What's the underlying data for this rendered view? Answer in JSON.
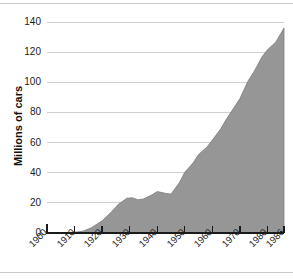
{
  "chart_data": {
    "type": "area",
    "title": "",
    "subtitle": "",
    "xlabel": "",
    "ylabel": "Millions of cars",
    "xlim": [
      1900,
      1986
    ],
    "ylim": [
      0,
      140
    ],
    "grid": true,
    "legend": null,
    "fill_color": "#969696",
    "line_color": "#7d7d7d",
    "grid_color": "#d0d0d0",
    "axis_color": "#1a1a1a",
    "y_ticks": [
      0,
      20,
      40,
      60,
      80,
      100,
      120,
      140
    ],
    "y_tick_labels": [
      "0",
      "20",
      "40",
      "60",
      "80",
      "100",
      "120",
      "140"
    ],
    "x_ticks": [
      1900,
      1910,
      1920,
      1930,
      1940,
      1950,
      1960,
      1970,
      1980,
      1986
    ],
    "x_tick_labels": [
      "1900",
      "1910",
      "1920",
      "1930",
      "1940",
      "1950",
      "1960",
      "1970",
      "1980",
      "1986"
    ],
    "x": [
      1900,
      1905,
      1910,
      1913,
      1916,
      1920,
      1923,
      1926,
      1929,
      1931,
      1933,
      1935,
      1938,
      1940,
      1943,
      1945,
      1948,
      1950,
      1953,
      1955,
      1958,
      1960,
      1963,
      1965,
      1968,
      1970,
      1973,
      1975,
      1978,
      1980,
      1983,
      1986
    ],
    "values": [
      0,
      0.2,
      0.5,
      1.2,
      3.4,
      8.1,
      13.3,
      19.2,
      23.1,
      23.4,
      22.0,
      22.6,
      25.2,
      27.5,
      26.3,
      25.8,
      33.3,
      40.3,
      46.5,
      52.1,
      56.9,
      61.7,
      69.0,
      75.3,
      83.6,
      89.2,
      101.0,
      106.7,
      116.8,
      121.6,
      126.6,
      136.0
    ]
  },
  "y_axis": {
    "title": "Millions of cars"
  }
}
